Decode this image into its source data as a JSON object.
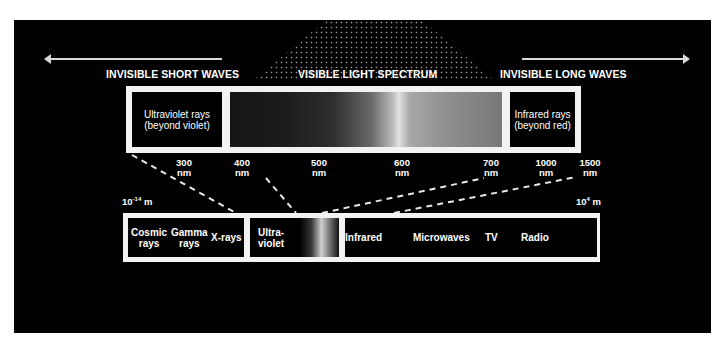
{
  "headers": {
    "short": "INVISIBLE SHORT WAVES",
    "visible": "VISIBLE LIGHT SPECTRUM",
    "long": "INVISIBLE LONG WAVES"
  },
  "upper_box": {
    "uv_line1": "Ultraviolet rays",
    "uv_line2": "(beyond violet)",
    "ir_line1": "Infrared rays",
    "ir_line2": "(beyond red)"
  },
  "wavelengths": [
    {
      "value": "300",
      "unit": "nm"
    },
    {
      "value": "400",
      "unit": "nm"
    },
    {
      "value": "500",
      "unit": "nm"
    },
    {
      "value": "600",
      "unit": "nm"
    },
    {
      "value": "700",
      "unit": "nm"
    },
    {
      "value": "1000",
      "unit": "nm"
    },
    {
      "value": "1500",
      "unit": "nm"
    }
  ],
  "scale": {
    "min_base": "10",
    "min_exp": "-14",
    "min_unit": "m",
    "max_base": "10",
    "max_exp": "4",
    "max_unit": "m"
  },
  "lower_box": {
    "cosmic_1": "Cosmic",
    "cosmic_2": "rays",
    "gamma_1": "Gamma",
    "gamma_2": "rays",
    "xrays": "X-rays",
    "uv_1": "Ultra-",
    "uv_2": "violet",
    "infrared": "Infrared",
    "microwaves": "Microwaves",
    "tv": "TV",
    "radio": "Radio"
  },
  "colors": {
    "background": "#000000",
    "frame": "#f2f2f2",
    "text": "#ffffff"
  }
}
